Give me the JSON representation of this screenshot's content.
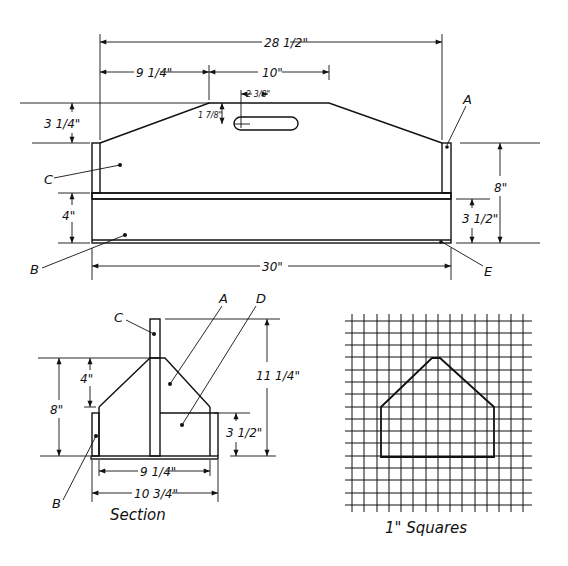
{
  "front_view": {
    "overall_top_width": "28 1/2\"",
    "left_slope_width": "9 1/4\"",
    "flat_top_width": "10\"",
    "slot_offset": "2 3/8\"",
    "slot_drop": "1 7/8\"",
    "slope_height": "3 1/4\"",
    "side_height": "4\"",
    "overall_height": "8\"",
    "box_height": "3 1/2\"",
    "overall_length": "30\"",
    "labels": {
      "a": "A",
      "b": "B",
      "c": "C",
      "e": "E"
    }
  },
  "section_view": {
    "caption": "Section",
    "top_height": "4\"",
    "end_height": "8\"",
    "total_height": "11 1/4\"",
    "box_height": "3 1/2\"",
    "inner_width": "9 1/4\"",
    "outer_width": "10 3/4\"",
    "labels": {
      "a": "A",
      "b": "B",
      "c": "C",
      "d": "D"
    }
  },
  "grid_view": {
    "caption": "1\" Squares"
  }
}
